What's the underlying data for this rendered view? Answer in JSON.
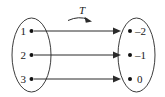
{
  "figure": {
    "name": "linear-transformation-mapping-diagram",
    "map_label": "T",
    "domain_set": {
      "name": "domain-oval",
      "elements": [
        {
          "label": "1"
        },
        {
          "label": "2"
        },
        {
          "label": "3"
        }
      ]
    },
    "codomain_set": {
      "name": "codomain-oval",
      "elements": [
        {
          "label": "–2"
        },
        {
          "label": "–1"
        },
        {
          "label": "0"
        }
      ]
    },
    "mappings": [
      {
        "from": "1",
        "to": "–2"
      },
      {
        "from": "2",
        "to": "–1"
      },
      {
        "from": "3",
        "to": "0"
      }
    ],
    "colors": {
      "background": "#ffffff",
      "stroke": "#2b2b2b",
      "oval_stroke": "#3c3c3c",
      "dot": "#111111",
      "text": "#1a1a1a"
    }
  }
}
